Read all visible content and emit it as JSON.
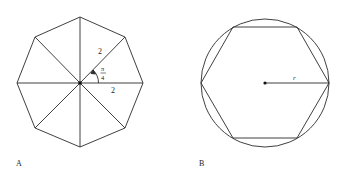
{
  "figures": [
    {
      "id": "A",
      "label": "A",
      "shape": "regular octagon divided into 8 triangles from center",
      "side_label_1": "2",
      "side_label_2": "2",
      "angle_label_num": "π",
      "angle_label_den": "4"
    },
    {
      "id": "B",
      "label": "B",
      "shape": "regular hexagon inscribed in a circle",
      "radius_label": "r"
    }
  ],
  "colors": {
    "stroke": "#2a2a2a",
    "background": "#ffffff"
  }
}
